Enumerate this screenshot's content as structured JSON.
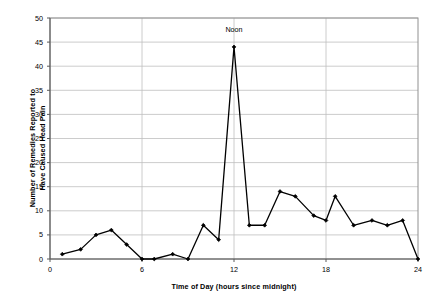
{
  "chart_data": {
    "type": "line",
    "title": "",
    "xlabel": "Time of Day (hours since midnight)",
    "ylabel": "Number of Remedies Reported to Have Caused Head Pain",
    "ylabel_line1": "Number of Remedies Reported to",
    "ylabel_line2": "Have Caused Head Pain",
    "xlim": [
      0,
      24
    ],
    "ylim": [
      0,
      50
    ],
    "xticks": [
      0,
      6,
      12,
      18,
      24
    ],
    "yticks": [
      0,
      5,
      10,
      15,
      20,
      25,
      30,
      35,
      40,
      45,
      50
    ],
    "xtick_labels": [
      "0",
      "6",
      "12",
      "18",
      "24"
    ],
    "ytick_labels": [
      "0",
      "5",
      "10",
      "15",
      "20",
      "25",
      "30",
      "35",
      "40",
      "45",
      "50"
    ],
    "grid": "horizontal-and-vertical",
    "legend": "none",
    "marker": "filled-diamond",
    "line_color": "#000000",
    "grid_color": "#bfbfbf",
    "axis_color": "#808080",
    "annotations": [
      {
        "text": "Noon",
        "x": 12,
        "y": 47.5
      }
    ],
    "series": [
      {
        "name": "Remedies reported to have caused head pain",
        "points": [
          {
            "x": 0.8,
            "y": 1
          },
          {
            "x": 2.0,
            "y": 2
          },
          {
            "x": 3.0,
            "y": 5
          },
          {
            "x": 4.0,
            "y": 6
          },
          {
            "x": 5.0,
            "y": 3
          },
          {
            "x": 6.0,
            "y": 0
          },
          {
            "x": 6.8,
            "y": 0
          },
          {
            "x": 8.0,
            "y": 1
          },
          {
            "x": 9.0,
            "y": 0
          },
          {
            "x": 10.0,
            "y": 7
          },
          {
            "x": 11.0,
            "y": 4
          },
          {
            "x": 12.0,
            "y": 44
          },
          {
            "x": 13.0,
            "y": 7
          },
          {
            "x": 14.0,
            "y": 7
          },
          {
            "x": 15.0,
            "y": 14
          },
          {
            "x": 16.0,
            "y": 13
          },
          {
            "x": 17.2,
            "y": 9
          },
          {
            "x": 18.0,
            "y": 8
          },
          {
            "x": 18.6,
            "y": 13
          },
          {
            "x": 19.8,
            "y": 7
          },
          {
            "x": 21.0,
            "y": 8
          },
          {
            "x": 22.0,
            "y": 7
          },
          {
            "x": 23.0,
            "y": 8
          },
          {
            "x": 24.0,
            "y": 0
          }
        ]
      }
    ]
  }
}
